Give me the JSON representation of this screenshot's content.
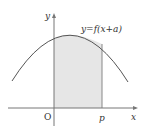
{
  "diagram": {
    "curve_label": "y=f(x+a)",
    "y_axis_label": "y",
    "x_axis_label": "x",
    "origin_label": "O",
    "p_label": "p",
    "colors": {
      "curve": "#555555",
      "axis": "#777777",
      "shade": "#e6e6e6",
      "shade_edge": "#888888"
    }
  }
}
